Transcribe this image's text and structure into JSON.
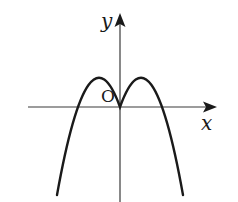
{
  "diagram": {
    "type": "coordinate-plane-with-parabola",
    "axes": {
      "x_label": "x",
      "y_label": "y",
      "origin_label": "O"
    },
    "curve": {
      "kind": "parabola",
      "opens": "down",
      "vertex": "origin"
    },
    "colors": {
      "background": "#ffffff",
      "axis": "#3a3a3a",
      "curve": "#1a1a1a",
      "text": "#1a1a1a"
    }
  }
}
